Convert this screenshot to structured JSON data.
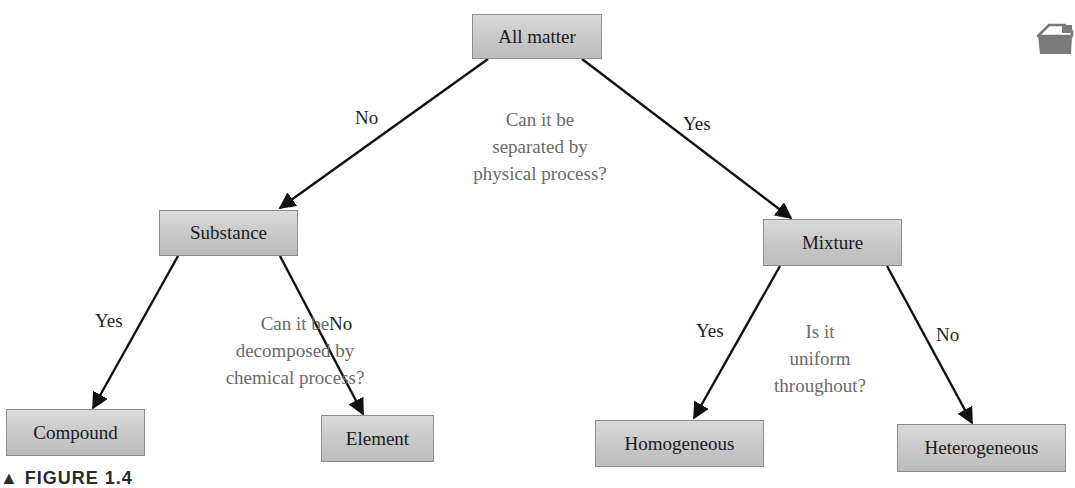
{
  "diagram": {
    "type": "decision-tree",
    "nodes": {
      "root": {
        "label": "All matter"
      },
      "substance": {
        "label": "Substance"
      },
      "mixture": {
        "label": "Mixture"
      },
      "compound": {
        "label": "Compound"
      },
      "element": {
        "label": "Element"
      },
      "homogeneous": {
        "label": "Homogeneous"
      },
      "heterogeneous": {
        "label": "Heterogeneous"
      }
    },
    "edges": [
      {
        "from": "All matter",
        "to": "Substance",
        "label": "No"
      },
      {
        "from": "All matter",
        "to": "Mixture",
        "label": "Yes"
      },
      {
        "from": "Substance",
        "to": "Compound",
        "label": "Yes"
      },
      {
        "from": "Substance",
        "to": "Element",
        "label": "No"
      },
      {
        "from": "Mixture",
        "to": "Homogeneous",
        "label": "Yes"
      },
      {
        "from": "Mixture",
        "to": "Heterogeneous",
        "label": "No"
      }
    ],
    "edge_labels": {
      "root_no": "No",
      "root_yes": "Yes",
      "substance_yes": "Yes",
      "substance_no": "No",
      "mixture_yes": "Yes",
      "mixture_no": "No"
    },
    "questions": {
      "root": [
        "Can it be",
        "separated by",
        "physical process?"
      ],
      "substance": [
        "Can it be",
        "decomposed by",
        "chemical process?"
      ],
      "mixture": [
        "Is it",
        "uniform",
        "throughout?"
      ]
    }
  },
  "caption": {
    "text": "▲ FIGURE 1.4"
  },
  "corner_icon": {
    "name": "page-corner-marker"
  },
  "colors": {
    "node_fill": "#c8c8c8",
    "node_border": "#8c8c8c",
    "edge": "#111111",
    "question_text": "#6a6a6a",
    "label_text": "#1f1f1f"
  }
}
